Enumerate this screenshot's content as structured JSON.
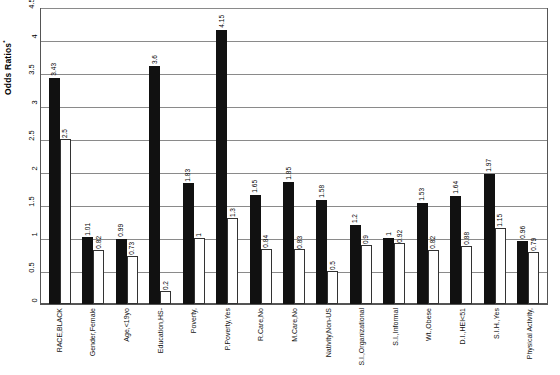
{
  "chart_data": {
    "type": "bar",
    "title": "",
    "xlabel": "",
    "ylabel": "Odds Ratios",
    "ylabel_sup": "*",
    "ylim": [
      0,
      4.5
    ],
    "yticks": [
      "0",
      "0.5",
      "1",
      "1.5",
      "2",
      "2.5",
      "3",
      "3.5",
      "4",
      "4.5"
    ],
    "grid": true,
    "legend": "none",
    "categories": [
      "RACE,BLACK",
      "Gender,Female",
      "Age,<19yo",
      "Education,HS-",
      "Poverty,",
      "P.Poverty,Yes",
      "R.Care,No",
      "M.Care,No",
      "Nativity,Non-US",
      "S.I.,Organizational",
      "S.I.,Informal",
      "Wt.,Obese",
      "D.I.,HEI<51",
      "S.I.H.,Yes",
      "Physical Activity,"
    ],
    "series": [
      {
        "name": "Unadjusted",
        "color": "#111111",
        "values": [
          3.43,
          1.01,
          0.99,
          3.6,
          1.83,
          4.15,
          1.65,
          1.85,
          1.58,
          1.2,
          1,
          1.53,
          1.64,
          1.97,
          0.96
        ],
        "labels": [
          "3.43",
          "1.01",
          "0.99",
          "3.6",
          "1.83",
          "4.15",
          "1.65",
          "1.85",
          "1.58",
          "1.2",
          "1",
          "1.53",
          "1.64",
          "1.97",
          "0.96"
        ]
      },
      {
        "name": "Adjusted",
        "color": "#ffffff",
        "values": [
          2.5,
          0.82,
          0.73,
          0.2,
          1,
          1.3,
          0.84,
          0.83,
          0.5,
          0.9,
          0.92,
          0.82,
          0.88,
          1.15,
          0.79
        ],
        "labels": [
          "2.5",
          "0.82",
          "0.73",
          "0.2",
          "1",
          "1.3",
          "0.84",
          "0.83",
          "0.5",
          "0.9",
          "0.92",
          "0.82",
          "0.88",
          "1.15",
          "0.79"
        ]
      }
    ]
  }
}
